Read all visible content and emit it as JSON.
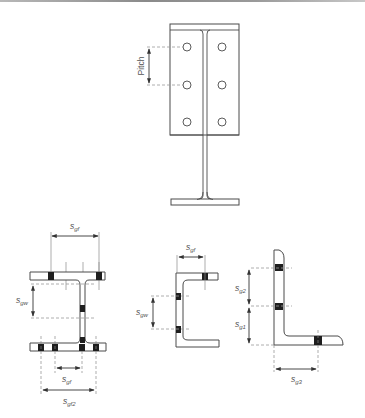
{
  "figure": {
    "colors": {
      "outline": "#4a4a4a",
      "bolt": "#1e1e1e",
      "dashed": "#9a9a9a",
      "label": "#555555"
    }
  },
  "plate_view": {
    "pitch_label": "Pitch",
    "hole_columns": 2,
    "hole_rows": 3
  },
  "i_section": {
    "labels": {
      "sgf_top": {
        "base": "s",
        "sub": "gf"
      },
      "sgw": {
        "base": "s",
        "sub": "gw"
      },
      "sgf_bottom": {
        "base": "s",
        "sub": "gf"
      },
      "sgf2": {
        "base": "s",
        "sub": "gf2"
      }
    }
  },
  "channel_section": {
    "labels": {
      "sgf": {
        "base": "s",
        "sub": "gf"
      },
      "sgw": {
        "base": "s",
        "sub": "gw"
      }
    }
  },
  "angle_section": {
    "labels": {
      "sg2": {
        "base": "s",
        "sub": "g2"
      },
      "sg1": {
        "base": "s",
        "sub": "g1"
      },
      "sg3": {
        "base": "s",
        "sub": "g3"
      }
    }
  }
}
